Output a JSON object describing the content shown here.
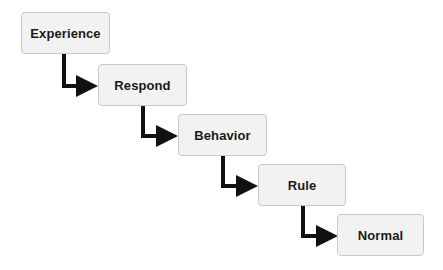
{
  "diagram": {
    "type": "staircase-flow",
    "colors": {
      "box_fill": "#f2f2f2",
      "box_border": "#c8c8c8",
      "text": "#1a1a1a",
      "arrow": "#111111"
    },
    "steps": [
      {
        "label": "Experience"
      },
      {
        "label": "Respond"
      },
      {
        "label": "Behavior"
      },
      {
        "label": "Rule"
      },
      {
        "label": "Normal"
      }
    ],
    "edges": [
      {
        "from": "Experience",
        "to": "Respond"
      },
      {
        "from": "Respond",
        "to": "Behavior"
      },
      {
        "from": "Behavior",
        "to": "Rule"
      },
      {
        "from": "Rule",
        "to": "Normal"
      }
    ]
  }
}
